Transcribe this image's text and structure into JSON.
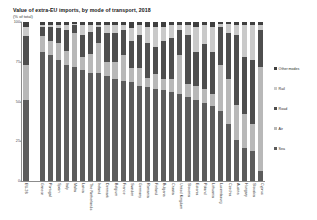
{
  "chart": {
    "title": "Value of extra-EU imports, by mode of transport, 2018",
    "subtitle": "(% of total)"
  },
  "legend": {
    "position": "right",
    "items": [
      {
        "label": "Other modes",
        "color": "#3f3f3f",
        "key": "other"
      },
      {
        "label": "Rail",
        "color": "#c9c9c9",
        "key": "rail"
      },
      {
        "label": "Road",
        "color": "#4e4e4e",
        "key": "road"
      },
      {
        "label": "Air",
        "color": "#b8b8b8",
        "key": "air"
      },
      {
        "label": "Sea",
        "color": "#5c5c5c",
        "key": "sea"
      }
    ]
  },
  "axes": {
    "y_ticks": [
      "100",
      "75",
      "50",
      "25",
      "0"
    ],
    "y_tick_values": [
      100,
      75,
      50,
      25,
      0
    ],
    "ylim": [
      0,
      100
    ],
    "grid": false
  },
  "chart_data": {
    "type": "bar",
    "subtype": "stacked-bar-100",
    "title": "Value of extra-EU imports, by mode of transport, 2018",
    "subtitle": "(% of total)",
    "xlabel": "",
    "ylabel": "(% of total)",
    "ylim": [
      0,
      100
    ],
    "grid": false,
    "legend_position": "right",
    "categories": [
      "EU-28",
      "",
      "Greece",
      "Portugal",
      "Spain",
      "Italy",
      "Malta",
      "Latvia",
      "The Netherlands",
      "Ireland",
      "Denmark",
      "Belgium",
      "France",
      "Sweden",
      "Germany",
      "Romania",
      "Finland",
      "Bulgaria",
      "Croatia",
      "United Kingdom",
      "Slovenia",
      "Estonia",
      "Poland",
      "Lithuania",
      "Luxembourg",
      "Czechia",
      "Austria",
      "Hungary",
      "Slovakia",
      "Cyprus"
    ],
    "series": [
      {
        "name": "Sea",
        "color": "#5c5c5c",
        "values": [
          51,
          null,
          81,
          79,
          76,
          73,
          72,
          70,
          68,
          68,
          66,
          64,
          63,
          62,
          60,
          59,
          58,
          57,
          56,
          55,
          53,
          51,
          49,
          47,
          44,
          36,
          26,
          21,
          19,
          6
        ]
      },
      {
        "name": "Air",
        "color": "#b8b8b8",
        "values": [
          22,
          null,
          10,
          9,
          11,
          9,
          21,
          8,
          12,
          19,
          9,
          11,
          16,
          9,
          11,
          6,
          9,
          7,
          8,
          24,
          8,
          9,
          9,
          8,
          29,
          28,
          22,
          21,
          17,
          66
        ]
      },
      {
        "name": "Road",
        "color": "#4e4e4e",
        "values": [
          18,
          null,
          6,
          9,
          9,
          13,
          5,
          14,
          14,
          10,
          18,
          18,
          16,
          17,
          21,
          22,
          17,
          24,
          26,
          16,
          31,
          21,
          28,
          26,
          24,
          29,
          44,
          36,
          40,
          23
        ]
      },
      {
        "name": "Rail",
        "color": "#c9c9c9",
        "values": [
          6,
          null,
          1,
          1,
          2,
          3,
          1,
          6,
          4,
          1,
          5,
          5,
          3,
          8,
          6,
          10,
          13,
          9,
          8,
          3,
          6,
          16,
          12,
          16,
          2,
          6,
          6,
          20,
          22,
          3
        ]
      },
      {
        "name": "Other modes",
        "color": "#3f3f3f",
        "values": [
          3,
          null,
          2,
          2,
          2,
          2,
          1,
          2,
          2,
          2,
          2,
          2,
          2,
          4,
          2,
          3,
          3,
          3,
          2,
          2,
          2,
          3,
          2,
          3,
          1,
          1,
          2,
          2,
          2,
          2
        ]
      }
    ],
    "stack_order_bottom_to_top": [
      "Sea",
      "Air",
      "Road",
      "Rail",
      "Other modes"
    ]
  }
}
